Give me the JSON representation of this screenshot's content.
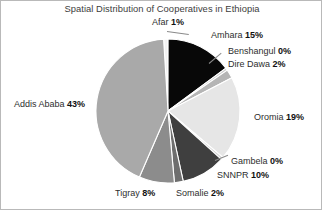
{
  "chart_data": {
    "type": "pie",
    "title": "Spatial Distribution of Cooperatives in Ethiopia",
    "xlabel": "",
    "ylabel": "",
    "grid": false,
    "legend_position": "outside-labels",
    "categories": [
      "Afar",
      "Amhara",
      "Benshangul",
      "Dire Dawa",
      "Oromia",
      "Gambela",
      "SNNPR",
      "Somalie",
      "Tigray",
      "Addis Ababa"
    ],
    "values": [
      1,
      15,
      0,
      2,
      19,
      0,
      10,
      2,
      8,
      43
    ],
    "unit": "%",
    "slices": [
      {
        "name": "Afar",
        "value": 1,
        "value_label": "1%",
        "color": "#f2f2f2"
      },
      {
        "name": "Amhara",
        "value": 15,
        "value_label": "15%",
        "color": "#080808"
      },
      {
        "name": "Benshangul",
        "value": 0,
        "value_label": "0%",
        "color": "#cfcfcf"
      },
      {
        "name": "Dire Dawa",
        "value": 2,
        "value_label": "2%",
        "color": "#b5b5b5"
      },
      {
        "name": "Oromia",
        "value": 19,
        "value_label": "19%",
        "color": "#e6e6e6"
      },
      {
        "name": "Gambela",
        "value": 0,
        "value_label": "0%",
        "color": "#cfcfcf"
      },
      {
        "name": "SNNPR",
        "value": 10,
        "value_label": "10%",
        "color": "#3f3f3f"
      },
      {
        "name": "Somalie",
        "value": 2,
        "value_label": "2%",
        "color": "#6e6e6e"
      },
      {
        "name": "Tigray",
        "value": 8,
        "value_label": "8%",
        "color": "#8c8c8c"
      },
      {
        "name": "Addis Ababa",
        "value": 43,
        "value_label": "43%",
        "color": "#a9a9a9"
      }
    ]
  },
  "labels": {
    "afar_name": "Afar",
    "afar_pct": "1%",
    "amhara_name": "Amhara",
    "amhara_pct": "15%",
    "benshangul_name": "Benshangul",
    "benshangul_pct": "0%",
    "diredawa_name": "Dire Dawa",
    "diredawa_pct": "2%",
    "oromia_name": "Oromia",
    "oromia_pct": "19%",
    "gambela_name": "Gambela",
    "gambela_pct": "0%",
    "snnpr_name": "SNNPR",
    "snnpr_pct": "10%",
    "somalie_name": "Somalie",
    "somalie_pct": "2%",
    "tigray_name": "Tigray",
    "tigray_pct": "8%",
    "addisababa_name": "Addis Ababa",
    "addisababa_pct": "43%"
  }
}
